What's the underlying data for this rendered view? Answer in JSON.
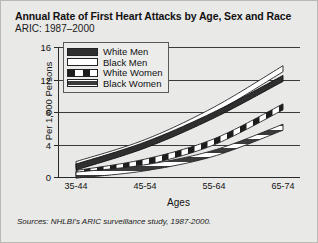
{
  "figure": {
    "title": "Annual Rate of First Heart Attacks by Age, Sex and Race",
    "subtitle": "ARIC: 1987–2000",
    "source": "Sources: NHLBI's ARIC surveillance study, 1987-2000."
  },
  "legend": {
    "items": [
      {
        "label": "White Men",
        "swatch": "solid-black-swatch"
      },
      {
        "label": "Black Men",
        "swatch": "white-outline-swatch"
      },
      {
        "label": "White Women",
        "swatch": "checkered-swatch"
      },
      {
        "label": "Black Women",
        "swatch": "striped-swatch"
      }
    ]
  },
  "chart_data": {
    "type": "line",
    "title": "Annual Rate of First Heart Attacks by Age, Sex and Race",
    "subtitle": "ARIC: 1987–2000",
    "xlabel": "Ages",
    "ylabel": "Per 1,000 Persons",
    "categories": [
      "35-44",
      "45-54",
      "55-64",
      "65-74"
    ],
    "yticks": [
      0,
      4,
      8,
      12,
      16
    ],
    "ylim": [
      0,
      16
    ],
    "grid": true,
    "legend_position": "upper-left-inside",
    "series": [
      {
        "name": "White Men",
        "values": [
          1.6,
          4.3,
          8.0,
          12.5
        ]
      },
      {
        "name": "Black Men",
        "values": [
          1.9,
          4.6,
          8.6,
          13.7
        ]
      },
      {
        "name": "White Women",
        "values": [
          0.8,
          2.2,
          4.7,
          9.0
        ]
      },
      {
        "name": "Black Women",
        "values": [
          0.6,
          1.5,
          3.3,
          6.5
        ]
      }
    ]
  }
}
